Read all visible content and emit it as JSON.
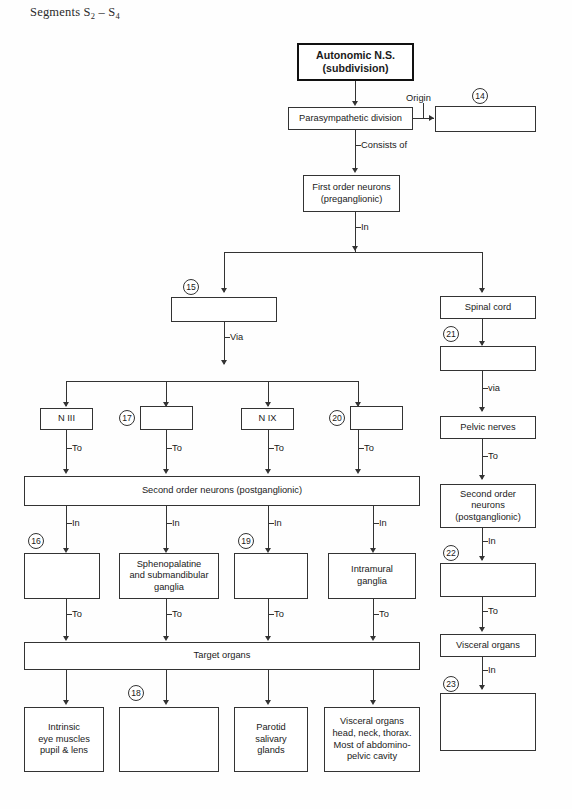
{
  "page": {
    "heading_prefix": "Segments S",
    "heading_sub1": "2",
    "heading_dash": " – S",
    "heading_sub2": "4",
    "heading_full": "Segments S2 – S4",
    "background_color": "#ffffff",
    "line_color": "#333333"
  },
  "diagram": {
    "type": "flowchart",
    "boxes": [
      {
        "id": "ans",
        "label": "Autonomic N.S.\n(subdivision)",
        "line1": "Autonomic N.S.",
        "line2": "(subdivision)",
        "style": "thick",
        "empty": false
      },
      {
        "id": "parasym",
        "line1": "Parasympathetic division",
        "style": "normal",
        "empty": false
      },
      {
        "id": "blank14",
        "line1": "",
        "style": "normal",
        "empty": true,
        "number": "14"
      },
      {
        "id": "first_order",
        "line1": "First order neurons",
        "line2": "(preganglionic)",
        "style": "normal",
        "empty": false
      },
      {
        "id": "blank15",
        "line1": "",
        "style": "normal",
        "empty": true,
        "number": "15"
      },
      {
        "id": "spinal_cord",
        "line1": "Spinal cord",
        "style": "normal",
        "empty": false
      },
      {
        "id": "blank21",
        "line1": "",
        "style": "normal",
        "empty": true,
        "number": "21"
      },
      {
        "id": "pelvic_nerves",
        "line1": "Pelvic nerves",
        "style": "normal",
        "empty": false
      },
      {
        "id": "n3",
        "line1": "N III",
        "style": "normal",
        "empty": false
      },
      {
        "id": "blank17",
        "line1": "",
        "style": "normal",
        "empty": true,
        "number": "17"
      },
      {
        "id": "n9",
        "line1": "N IX",
        "style": "normal",
        "empty": false
      },
      {
        "id": "blank20",
        "line1": "",
        "style": "normal",
        "empty": true,
        "number": "20"
      },
      {
        "id": "second_order_l",
        "line1": "Second order neurons (postganglionic)",
        "style": "normal",
        "empty": false
      },
      {
        "id": "second_order_r",
        "line1": "Second order",
        "line2": "neurons",
        "line3": "(postganglionic)",
        "style": "normal",
        "empty": false
      },
      {
        "id": "blank16",
        "line1": "",
        "style": "normal",
        "empty": true,
        "number": "16"
      },
      {
        "id": "spheno",
        "line1": "Sphenopalatine",
        "line2": "and submandibular",
        "line3": "ganglia",
        "style": "normal",
        "empty": false
      },
      {
        "id": "blank19",
        "line1": "",
        "style": "normal",
        "empty": true,
        "number": "19"
      },
      {
        "id": "intramural",
        "line1": "Intramural",
        "line2": "ganglia",
        "style": "normal",
        "empty": false
      },
      {
        "id": "blank22",
        "line1": "",
        "style": "normal",
        "empty": true,
        "number": "22"
      },
      {
        "id": "target_organs",
        "line1": "Target organs",
        "style": "normal",
        "empty": false
      },
      {
        "id": "visceral_r",
        "line1": "Visceral organs",
        "style": "normal",
        "empty": false
      },
      {
        "id": "blank23",
        "line1": "",
        "style": "normal",
        "empty": true,
        "number": "23"
      },
      {
        "id": "intrinsic_eye",
        "line1": "Intrinsic",
        "line2": "eye muscles",
        "line3": "pupil & lens",
        "style": "normal",
        "empty": false
      },
      {
        "id": "blank18",
        "line1": "",
        "style": "normal",
        "empty": true,
        "number": "18"
      },
      {
        "id": "parotid",
        "line1": "Parotid",
        "line2": "salivary",
        "line3": "glands",
        "style": "normal",
        "empty": false
      },
      {
        "id": "visceral_b",
        "line1": "Visceral organs",
        "line2": "head, neck, thorax.",
        "line3": "Most of abdomino-",
        "line4": "pelvic cavity",
        "style": "normal",
        "empty": false
      }
    ],
    "text": {
      "ans_line1": "Autonomic N.S.",
      "ans_line2": "(subdivision)",
      "parasym": "Parasympathetic division",
      "first_order_l1": "First order neurons",
      "first_order_l2": "(preganglionic)",
      "spinal_cord": "Spinal cord",
      "pelvic_nerves": "Pelvic nerves",
      "n3": "N III",
      "n9": "N IX",
      "second_order_wide": "Second order neurons (postganglionic)",
      "second_order_r_l1": "Second order",
      "second_order_r_l2": "neurons",
      "second_order_r_l3": "(postganglionic)",
      "spheno_l1": "Sphenopalatine",
      "spheno_l2": "and submandibular",
      "spheno_l3": "ganglia",
      "intramural_l1": "Intramural",
      "intramural_l2": "ganglia",
      "target_organs": "Target organs",
      "visceral_right": "Visceral organs",
      "intrinsic_l1": "Intrinsic",
      "intrinsic_l2": "eye muscles",
      "intrinsic_l3": "pupil & lens",
      "parotid_l1": "Parotid",
      "parotid_l2": "salivary",
      "parotid_l3": "glands",
      "visceral_b_l1": "Visceral organs",
      "visceral_b_l2": "head, neck, thorax.",
      "visceral_b_l3": "Most of abdomino-",
      "visceral_b_l4": "pelvic cavity"
    },
    "edge_labels": {
      "origin": "Origin",
      "consists_of": "Consists of",
      "in_main": "In",
      "via_left": "Via",
      "via_right": "via",
      "to_n3": "To",
      "to_17": "To",
      "to_n9": "To",
      "to_20": "To",
      "to_pelvic": "To",
      "in_16": "In",
      "in_spheno": "In",
      "in_19": "In",
      "in_intramural": "In",
      "in_22": "In",
      "to_16": "To",
      "to_spheno": "To",
      "to_19": "To",
      "to_intramural": "To",
      "to_22": "To",
      "in_23": "In"
    },
    "numbers": {
      "n14": "14",
      "n15": "15",
      "n16": "16",
      "n17": "17",
      "n18": "18",
      "n19": "19",
      "n20": "20",
      "n21": "21",
      "n22": "22",
      "n23": "23"
    }
  }
}
